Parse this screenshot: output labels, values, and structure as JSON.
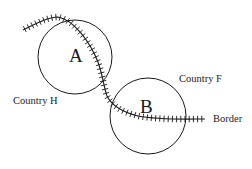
{
  "diagram": {
    "type": "map-schematic",
    "circles": [
      {
        "label": "A",
        "cx": 75,
        "cy": 57,
        "r": 37
      },
      {
        "label": "B",
        "cx": 148,
        "cy": 116,
        "r": 38
      }
    ],
    "labels": {
      "circle_a": "A",
      "circle_b": "B",
      "country_h": "Country H",
      "country_f": "Country F",
      "border": "Border"
    },
    "colors": {
      "stroke": "#1a1a1a",
      "background": "#ffffff"
    }
  }
}
